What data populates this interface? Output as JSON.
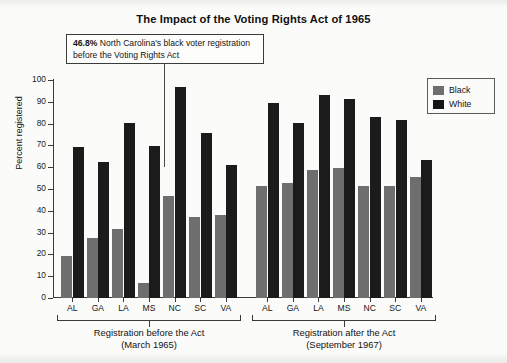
{
  "chart_data": {
    "type": "bar",
    "title": "The Impact of the Voting Rights Act of 1965",
    "xlabel": "",
    "ylabel": "Percent registered",
    "ylim": [
      0,
      100
    ],
    "ytick_step": 10,
    "yticks": [
      "100",
      "90",
      "80",
      "70",
      "60",
      "50",
      "40",
      "30",
      "20",
      "10",
      "0"
    ],
    "grid": false,
    "legend_position": "top-right",
    "legend": [
      "Black",
      "White"
    ],
    "groups": [
      {
        "name": "before",
        "label_line1": "Registration before the Act",
        "label_line2": "(March 1965)",
        "categories": [
          "AL",
          "GA",
          "LA",
          "MS",
          "NC",
          "SC",
          "VA"
        ],
        "series": [
          {
            "name": "Black",
            "values": [
              19.3,
              27.4,
              31.6,
              6.7,
              46.8,
              37.3,
              38.3
            ]
          },
          {
            "name": "White",
            "values": [
              69.2,
              62.6,
              80.5,
              69.9,
              96.8,
              75.7,
              61.1
            ]
          }
        ]
      },
      {
        "name": "after",
        "label_line1": "Registration after the Act",
        "label_line2": "(September 1967)",
        "categories": [
          "AL",
          "GA",
          "LA",
          "MS",
          "NC",
          "SC",
          "VA"
        ],
        "series": [
          {
            "name": "Black",
            "values": [
              51.6,
              52.6,
              58.9,
              59.8,
              51.3,
              51.2,
              55.6
            ]
          },
          {
            "name": "White",
            "values": [
              89.6,
              80.3,
              93.1,
              91.5,
              83.0,
              81.7,
              63.4
            ]
          }
        ]
      }
    ],
    "annotation": {
      "value": "46.8%",
      "text": " North Carolina's black voter registration before the Voting Rights Act",
      "points_to": {
        "group": "before",
        "category": "NC",
        "series": "Black"
      }
    },
    "colors": {
      "black_series": "#6e6e6e",
      "white_series": "#1b1b1b",
      "axis": "#3a3a3a",
      "background": "#fbfbfa",
      "text": "#141414"
    }
  }
}
